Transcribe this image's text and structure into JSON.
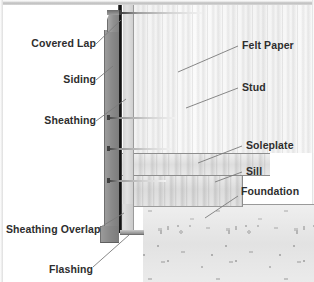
{
  "labels": {
    "left": [
      {
        "id": "covered-lap",
        "text": "Covered Lap",
        "x": 14,
        "y": 38,
        "leader": {
          "x1": 96,
          "y1": 44,
          "x2": 121,
          "y2": 20
        }
      },
      {
        "id": "siding",
        "text": "Siding",
        "x": 54,
        "y": 74,
        "leader": {
          "x1": 96,
          "y1": 80,
          "x2": 113,
          "y2": 66
        }
      },
      {
        "id": "sheathing",
        "text": "Sheathing",
        "x": 34,
        "y": 115,
        "leader": {
          "x1": 96,
          "y1": 121,
          "x2": 126,
          "y2": 99
        }
      },
      {
        "id": "sheathing-overlap",
        "text": "Sheathing Overlap",
        "x": 10,
        "y": 224,
        "leader": {
          "x1": 99,
          "y1": 228,
          "x2": 124,
          "y2": 213
        }
      },
      {
        "id": "flashing",
        "text": "Flashing",
        "x": 44,
        "y": 264,
        "leader": {
          "x1": 93,
          "y1": 267,
          "x2": 129,
          "y2": 235
        }
      }
    ],
    "right": [
      {
        "id": "felt-paper",
        "text": "Felt Paper",
        "x": 242,
        "y": 40,
        "leader": {
          "x1": 238,
          "y1": 46,
          "x2": 178,
          "y2": 72
        }
      },
      {
        "id": "stud",
        "text": "Stud",
        "x": 242,
        "y": 82,
        "leader": {
          "x1": 238,
          "y1": 88,
          "x2": 186,
          "y2": 108
        }
      },
      {
        "id": "soleplate",
        "text": "Soleplate",
        "x": 246,
        "y": 140,
        "leader": {
          "x1": 242,
          "y1": 146,
          "x2": 198,
          "y2": 163
        }
      },
      {
        "id": "sill",
        "text": "Sill",
        "x": 246,
        "y": 166,
        "leader": {
          "x1": 242,
          "y1": 172,
          "x2": 215,
          "y2": 182
        }
      },
      {
        "id": "foundation",
        "text": "Foundation",
        "x": 241,
        "y": 186,
        "leader": {
          "x1": 238,
          "y1": 196,
          "x2": 205,
          "y2": 218
        }
      }
    ]
  },
  "colors": {
    "siding": "#8b8b8b",
    "felt_paper": "#121212",
    "sheathing": "#d3d3d3",
    "stud": "#f7f7f7",
    "soleplate": "#dedede",
    "sill": "#dcdcdc",
    "foundation": "#e6e6e6",
    "flashing": "#8a8a8a",
    "label_text": "#2e2e2e",
    "leader_line": "#7a7a7a",
    "background": "#ffffff"
  }
}
